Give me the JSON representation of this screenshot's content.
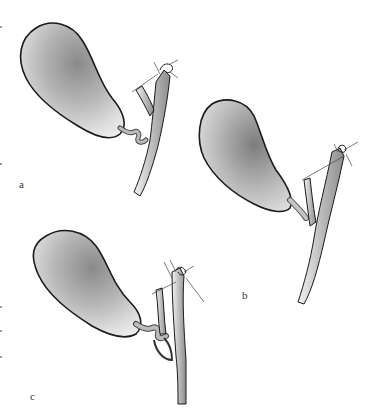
{
  "figure": {
    "panels": [
      {
        "id": "a",
        "label": "a",
        "label_pos": [
          19,
          186
        ]
      },
      {
        "id": "b",
        "label": "b",
        "label_pos": [
          243,
          297
        ]
      },
      {
        "id": "c",
        "label": "c",
        "label_pos": [
          31,
          398
        ]
      }
    ]
  },
  "colors": {
    "outline": "#1a1a1a",
    "shade_dark": "#7a7a7a",
    "shade_light": "#e8e8e8",
    "background": "#ffffff"
  }
}
